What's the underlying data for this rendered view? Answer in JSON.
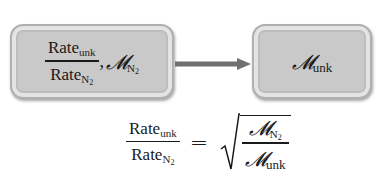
{
  "diagram": {
    "box_left": {
      "fraction_numerator": "Rate",
      "fraction_numerator_sub": "unk",
      "fraction_denominator": "Rate",
      "fraction_denominator_sub": "N",
      "fraction_denominator_subsub": "2",
      "separator": ",",
      "molar_mass_symbol": "𝓜",
      "molar_mass_sub": "N",
      "molar_mass_subsub": "2"
    },
    "arrow": {
      "direction": "right",
      "color": "#6f6f6f"
    },
    "box_right": {
      "molar_mass_symbol": "𝓜",
      "molar_mass_sub": "unk"
    },
    "equation": {
      "lhs_numerator": "Rate",
      "lhs_numerator_sub": "unk",
      "lhs_denominator": "Rate",
      "lhs_denominator_sub": "N",
      "lhs_denominator_subsub": "2",
      "equals": "=",
      "rhs_numerator_symbol": "𝓜",
      "rhs_numerator_sub": "N",
      "rhs_numerator_subsub": "2",
      "rhs_denominator_symbol": "𝓜",
      "rhs_denominator_sub": "unk"
    },
    "colors": {
      "box_fill": "#c9c9c9",
      "box_border": "#b0b0b0",
      "text": "#1a1a1a"
    }
  }
}
